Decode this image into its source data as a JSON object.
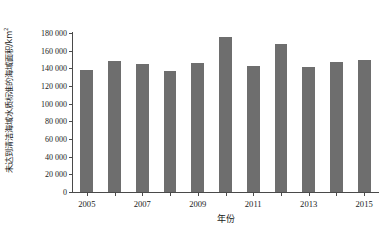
{
  "chart_data": {
    "type": "bar",
    "title": "",
    "xlabel": "年份",
    "ylabel": "未达到清洁海域水质标准的海域面积/km²",
    "ylabel_text": "未达到清洁海域水质标准的海域面积/km",
    "ylabel_sup": "2",
    "categories": [
      "2005",
      "2006",
      "2007",
      "2008",
      "2009",
      "2010",
      "2011",
      "2012",
      "2013",
      "2014",
      "2015"
    ],
    "values": [
      138500,
      148500,
      145000,
      136500,
      146000,
      176000,
      143000,
      168000,
      142000,
      147000,
      150000
    ],
    "ylim": [
      0,
      180000
    ],
    "ytick_values": [
      0,
      20000,
      40000,
      60000,
      80000,
      100000,
      120000,
      140000,
      160000,
      180000
    ],
    "ytick_labels": [
      "0",
      "20 000",
      "40 000",
      "60 000",
      "80 000",
      "100 000",
      "120 000",
      "140 000",
      "160 000",
      "180 000"
    ],
    "xtick_labels": [
      "2005",
      "2007",
      "2009",
      "2011",
      "2013",
      "2015"
    ],
    "xtick_categories": [
      "2005",
      "2007",
      "2009",
      "2011",
      "2013",
      "2015"
    ],
    "grid": false,
    "legend": null,
    "bar_color": "#6e6e6e",
    "axis_color": "#4a4a4a",
    "background": "#ffffff"
  }
}
